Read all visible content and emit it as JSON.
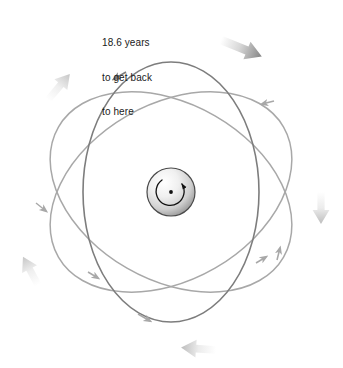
{
  "diagram": {
    "background_color": "#ffffff",
    "center": {
      "x": 171,
      "y": 192
    },
    "annotation": {
      "name": "period-callout",
      "line1": "18.6 years",
      "line2": "to get back",
      "line3": "to here",
      "text_color": "#1a1a1a",
      "x": 102,
      "y": 14
    },
    "body": {
      "name": "earth-sphere",
      "shape": "sphere",
      "cx": 171,
      "cy": 192,
      "radius": 24,
      "outline_color": "#4a4a4a",
      "fill_light": "#fdfdfd",
      "fill_dark": "#9a9a9a",
      "rotation_indicator": {
        "name": "rotation-arrow",
        "direction": "counterclockwise",
        "radius": 14,
        "color": "#111111"
      },
      "pole_dot": {
        "cx": 171,
        "cy": 192,
        "r": 1.9,
        "color": "#111111"
      }
    },
    "orbits": [
      {
        "name": "orbit-ring-1",
        "label": "steep vertical orbit",
        "rx": 88,
        "ry": 130,
        "rotation_deg": 0,
        "stroke": "#7d7d7d",
        "stroke_width": 1.5,
        "arrow_at_deg": 250
      },
      {
        "name": "orbit-ring-2",
        "label": "orbit tilted clockwise",
        "rx": 88,
        "ry": 130,
        "rotation_deg": 60,
        "stroke": "#a8a8a8",
        "stroke_width": 1.5,
        "arrow_at_deg": 250
      },
      {
        "name": "orbit-ring-3",
        "label": "orbit tilted counterclockwise",
        "rx": 88,
        "ry": 130,
        "rotation_deg": 120,
        "stroke": "#a8a8a8",
        "stroke_width": 1.5,
        "arrow_at_deg": 250
      }
    ],
    "precession_arrows": [
      {
        "name": "precession-arrow-top-right",
        "x": 240,
        "y": 38,
        "angle_deg": 25,
        "length": 38,
        "color_from": "#e8e8e8",
        "color_to": "#8e8e8e"
      },
      {
        "name": "precession-arrow-top-left",
        "x": 53,
        "y": 92,
        "angle_deg": -55,
        "length": 34,
        "color_from": "#f4f4f4",
        "color_to": "#cfcfcf"
      },
      {
        "name": "precession-arrow-right",
        "x": 318,
        "y": 192,
        "angle_deg": 90,
        "length": 34,
        "color_from": "#f2f2f2",
        "color_to": "#cccccc"
      },
      {
        "name": "precession-arrow-left",
        "x": 25,
        "y": 272,
        "angle_deg": -120,
        "length": 32,
        "color_from": "#f4f4f4",
        "color_to": "#d2d2d2"
      },
      {
        "name": "precession-arrow-bottom",
        "x": 190,
        "y": 350,
        "angle_deg": 185,
        "length": 36,
        "color_from": "#f0f0f0",
        "color_to": "#c8c8c8"
      }
    ]
  }
}
